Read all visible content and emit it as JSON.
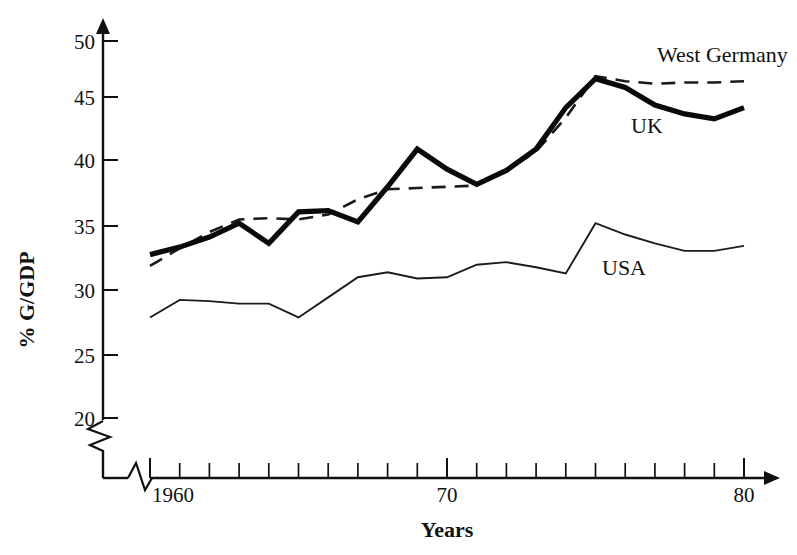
{
  "chart_data": {
    "type": "line",
    "title": "",
    "xlabel": "Years",
    "ylabel": "% G/GDP",
    "xlim": [
      1959,
      1980
    ],
    "ylim": [
      18,
      51
    ],
    "grid": false,
    "legend_position": "inline-right",
    "y_ticks": [
      20,
      25,
      30,
      35,
      40,
      45,
      50
    ],
    "y_tick_labels": [
      "20",
      "25",
      "30",
      "35",
      "40",
      "45",
      "50"
    ],
    "x_ticks": [
      1960,
      1961,
      1962,
      1963,
      1964,
      1965,
      1966,
      1967,
      1968,
      1969,
      1970,
      1971,
      1972,
      1973,
      1974,
      1975,
      1976,
      1977,
      1978,
      1979,
      1980
    ],
    "x_tick_labels": [
      "1960",
      "",
      "",
      "",
      "",
      "",
      "",
      "",
      "",
      "",
      "70",
      "",
      "",
      "",
      "",
      "",
      "",
      "",
      "",
      "",
      "80"
    ],
    "x_labeled_ticks": [
      "1960",
      "70",
      "80"
    ],
    "axis_break_y": true,
    "axis_break_x": true,
    "x": [
      1960,
      1961,
      1962,
      1963,
      1964,
      1965,
      1966,
      1967,
      1968,
      1969,
      1970,
      1971,
      1972,
      1973,
      1974,
      1975,
      1976,
      1977,
      1978,
      1979,
      1980
    ],
    "series": [
      {
        "name": "UK",
        "style": "thick-solid",
        "color": "#0a0a0a",
        "values": [
          33.0,
          33.6,
          34.4,
          35.5,
          33.9,
          36.4,
          36.5,
          35.6,
          38.4,
          41.4,
          39.8,
          38.6,
          39.7,
          41.4,
          44.7,
          47.0,
          46.3,
          44.9,
          44.2,
          43.8,
          44.7
        ]
      },
      {
        "name": "West Germany",
        "style": "dashed",
        "color": "#1a1a1a",
        "values": [
          32.1,
          33.5,
          34.8,
          35.8,
          35.9,
          35.8,
          36.2,
          37.4,
          38.2,
          38.3,
          38.4,
          38.5,
          39.7,
          41.2,
          43.9,
          47.2,
          46.8,
          46.6,
          46.7,
          46.7,
          46.8
        ]
      },
      {
        "name": "USA",
        "style": "thin-solid",
        "color": "#1c1c1c",
        "values": [
          28.0,
          29.4,
          29.3,
          29.1,
          29.1,
          28.0,
          29.6,
          31.2,
          31.6,
          31.1,
          31.2,
          32.2,
          32.4,
          32.0,
          31.5,
          35.5,
          34.6,
          33.9,
          33.3,
          33.3,
          33.7
        ]
      }
    ],
    "series_label_positions": [
      {
        "name": "West Germany",
        "x": 1979.2,
        "y": 49.2
      },
      {
        "name": "UK",
        "x": 1977.8,
        "y": 42.9
      },
      {
        "name": "USA",
        "x": 1975.6,
        "y": 31.7
      }
    ]
  },
  "labels": {
    "y_axis_title": "% G/GDP",
    "x_axis_title": "Years",
    "series_uk": "UK",
    "series_west_germany": "West Germany",
    "series_usa": "USA",
    "y_tick_20": "20",
    "y_tick_25": "25",
    "y_tick_30": "30",
    "y_tick_35": "35",
    "y_tick_40": "40",
    "y_tick_45": "45",
    "y_tick_50": "50",
    "x_tick_1960": "1960",
    "x_tick_70": "70",
    "x_tick_80": "80"
  },
  "icons": {
    "y_axis_arrow": "arrow-up-icon",
    "x_axis_arrow": "arrow-right-icon",
    "y_axis_break": "axis-break-zigzag-icon",
    "x_axis_break": "axis-break-zigzag-icon"
  }
}
